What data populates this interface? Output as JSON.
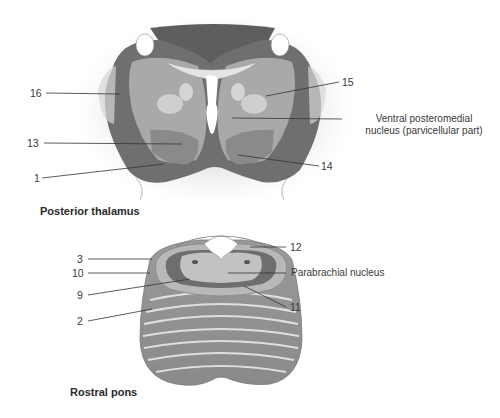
{
  "figure": {
    "panels": [
      {
        "id": "posterior-thalamus",
        "caption": "Posterior thalamus",
        "labels": {
          "l16": "16",
          "l13": "13",
          "l1": "1",
          "l15": "15",
          "l14": "14",
          "vpm_line1": "Ventral posteromedial",
          "vpm_line2": "nucleus (parvicellular part)"
        }
      },
      {
        "id": "rostral-pons",
        "caption": "Rostral pons",
        "labels": {
          "l3": "3",
          "l10": "10",
          "l9": "9",
          "l2": "2",
          "l12": "12",
          "parabrachial": "Parabrachial nucleus",
          "l11": "11"
        }
      }
    ]
  }
}
